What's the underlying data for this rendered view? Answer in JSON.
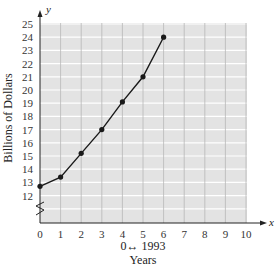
{
  "chart_data": {
    "type": "line",
    "title": "",
    "xlabel": "Years",
    "xlabel_note": "0↔ 1993",
    "ylabel": "Billions of Dollars",
    "x_axis_var": "x",
    "y_axis_var": "y",
    "x": [
      0,
      1,
      2,
      3,
      4,
      5,
      6
    ],
    "values": [
      12.7,
      13.4,
      15.2,
      17.0,
      19.1,
      21.0,
      24.0
    ],
    "x_ticks": [
      "0",
      "1",
      "2",
      "3",
      "4",
      "5",
      "6",
      "7",
      "8",
      "9",
      "10"
    ],
    "y_ticks": [
      "12",
      "13",
      "14",
      "15",
      "16",
      "17",
      "18",
      "19",
      "20",
      "21",
      "22",
      "23",
      "24",
      "25"
    ],
    "xlim": [
      0,
      10
    ],
    "ylim": [
      11,
      25
    ],
    "y_axis_break": true,
    "grid": true,
    "legend": null,
    "colors": {
      "plot_bg": "#e3e3e3",
      "grid": "#ffffff",
      "vgrid": "#b8b8b8",
      "line": "#1a1a1a"
    }
  }
}
